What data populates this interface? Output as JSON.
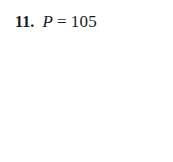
{
  "document": {
    "background_color": "#ffffff",
    "text_color": "#1c1c1c"
  },
  "answer_item": {
    "number_label": "11.",
    "variable": "P",
    "operator": "=",
    "value": "105"
  }
}
